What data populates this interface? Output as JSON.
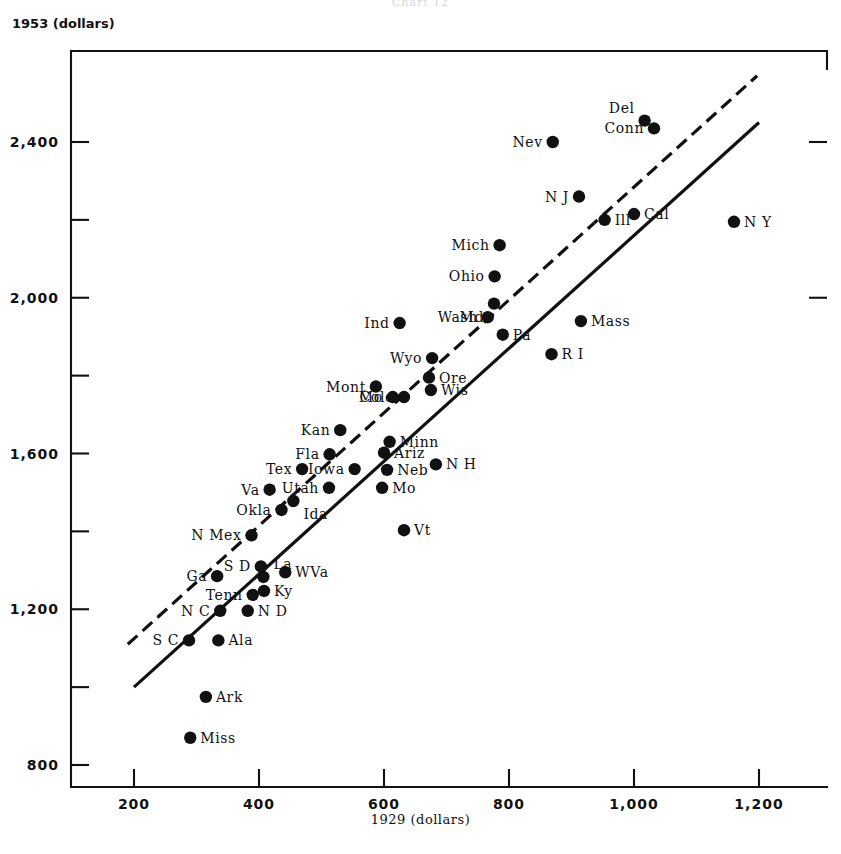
{
  "figure": {
    "cut_off_header": "Chart 12",
    "y_axis_caption": "1953 (dollars)",
    "x_axis_caption": "1929 (dollars)",
    "ink_color": "#111111",
    "background_color": "#ffffff"
  },
  "chart_data": {
    "type": "scatter",
    "title": "",
    "subtitle": "",
    "xlabel": "1929 (dollars)",
    "ylabel": "1953 (dollars)",
    "xlim": [
      130,
      1290
    ],
    "ylim": [
      760,
      2680
    ],
    "grid": false,
    "legend": "none",
    "x_ticks": [
      200,
      400,
      600,
      800,
      1000,
      1200
    ],
    "x_tick_labels": [
      "200",
      "400",
      "600",
      "800",
      "1,000",
      "1,200"
    ],
    "y_ticks": [
      800,
      1200,
      1600,
      2000,
      2400
    ],
    "y_tick_labels": [
      "800",
      "1,200",
      "1,600",
      "2,000",
      "2,400"
    ],
    "y_minor_ticks": [
      1000,
      1400,
      1800,
      2200
    ],
    "point_label": "State per-capita income",
    "points": [
      {
        "label": "Miss",
        "x": 290,
        "y": 870,
        "lx": -1,
        "ly": 0
      },
      {
        "label": "Ark",
        "x": 315,
        "y": 975,
        "lx": -1,
        "ly": 0
      },
      {
        "label": "S C",
        "x": 288,
        "y": 1120,
        "lx": 1,
        "ly": 0
      },
      {
        "label": "Ala",
        "x": 335,
        "y": 1120,
        "lx": -1,
        "ly": 0
      },
      {
        "label": "N C",
        "x": 338,
        "y": 1196,
        "lx": 1,
        "ly": 0
      },
      {
        "label": "N D",
        "x": 382,
        "y": 1196,
        "lx": -1,
        "ly": 0
      },
      {
        "label": "Tenn",
        "x": 390,
        "y": 1237,
        "lx": 1,
        "ly": 0
      },
      {
        "label": "Ky",
        "x": 408,
        "y": 1247,
        "lx": -1,
        "ly": 0
      },
      {
        "label": "Ga",
        "x": 333,
        "y": 1285,
        "lx": 1,
        "ly": 0
      },
      {
        "label": "La",
        "x": 407,
        "y": 1283,
        "lx": -1,
        "ly": -1
      },
      {
        "label": "WVa",
        "x": 442,
        "y": 1295,
        "lx": -1,
        "ly": 0
      },
      {
        "label": "S D",
        "x": 403,
        "y": 1310,
        "lx": 1,
        "ly": 0
      },
      {
        "label": "N Mex",
        "x": 388,
        "y": 1390,
        "lx": 1,
        "ly": 0
      },
      {
        "label": "Vt",
        "x": 632,
        "y": 1403,
        "lx": -1,
        "ly": 0
      },
      {
        "label": "Okla",
        "x": 436,
        "y": 1455,
        "lx": 1,
        "ly": 0
      },
      {
        "label": "Ida",
        "x": 455,
        "y": 1478,
        "lx": -1,
        "ly": 1
      },
      {
        "label": "Va",
        "x": 417,
        "y": 1507,
        "lx": 1,
        "ly": 0
      },
      {
        "label": "Utah",
        "x": 512,
        "y": 1512,
        "lx": 1,
        "ly": 0
      },
      {
        "label": "Mo",
        "x": 597,
        "y": 1512,
        "lx": -1,
        "ly": 0
      },
      {
        "label": "Tex",
        "x": 469,
        "y": 1560,
        "lx": 1,
        "ly": 0
      },
      {
        "label": "Iowa",
        "x": 553,
        "y": 1560,
        "lx": 1,
        "ly": 0
      },
      {
        "label": "Neb",
        "x": 605,
        "y": 1558,
        "lx": -1,
        "ly": 0
      },
      {
        "label": "N H",
        "x": 683,
        "y": 1572,
        "lx": -1,
        "ly": 0
      },
      {
        "label": "Fla",
        "x": 513,
        "y": 1598,
        "lx": 1,
        "ly": 0
      },
      {
        "label": "Ariz",
        "x": 600,
        "y": 1602,
        "lx": -1,
        "ly": 0
      },
      {
        "label": "Minn",
        "x": 609,
        "y": 1630,
        "lx": -1,
        "ly": 0
      },
      {
        "label": "Kan",
        "x": 530,
        "y": 1660,
        "lx": 1,
        "ly": 0
      },
      {
        "label": "Mo",
        "x": 614,
        "y": 1745,
        "lx": 1,
        "ly": 0
      },
      {
        "label": "Mont",
        "x": 587,
        "y": 1772,
        "lx": 1,
        "ly": 0
      },
      {
        "label": "Colo",
        "x": 632,
        "y": 1745,
        "lx": 1,
        "ly": 0
      },
      {
        "label": "Wis",
        "x": 675,
        "y": 1763,
        "lx": -1,
        "ly": 0
      },
      {
        "label": "Ore",
        "x": 672,
        "y": 1795,
        "lx": -1,
        "ly": 0
      },
      {
        "label": "Wyo",
        "x": 677,
        "y": 1845,
        "lx": 1,
        "ly": 0
      },
      {
        "label": "R I",
        "x": 868,
        "y": 1855,
        "lx": -1,
        "ly": 0
      },
      {
        "label": "Ind",
        "x": 625,
        "y": 1935,
        "lx": 1,
        "ly": 0
      },
      {
        "label": "Wash",
        "x": 766,
        "y": 1950,
        "lx": 1,
        "ly": 0
      },
      {
        "label": "Mass",
        "x": 915,
        "y": 1940,
        "lx": -1,
        "ly": 0
      },
      {
        "label": "Pa",
        "x": 790,
        "y": 1905,
        "lx": -1,
        "ly": 0
      },
      {
        "label": "Md",
        "x": 776,
        "y": 1985,
        "lx": 1,
        "ly": 1
      },
      {
        "label": "Ohio",
        "x": 777,
        "y": 2055,
        "lx": 1,
        "ly": 0
      },
      {
        "label": "Mich",
        "x": 785,
        "y": 2135,
        "lx": 1,
        "ly": 0
      },
      {
        "label": "Ill",
        "x": 953,
        "y": 2200,
        "lx": -1,
        "ly": 0
      },
      {
        "label": "Cal",
        "x": 1000,
        "y": 2215,
        "lx": -1,
        "ly": 0
      },
      {
        "label": "N Y",
        "x": 1160,
        "y": 2195,
        "lx": -1,
        "ly": 0
      },
      {
        "label": "N J",
        "x": 912,
        "y": 2260,
        "lx": 1,
        "ly": 0
      },
      {
        "label": "Nev",
        "x": 870,
        "y": 2400,
        "lx": 1,
        "ly": 0
      },
      {
        "label": "Del",
        "x": 1017,
        "y": 2455,
        "lx": 1,
        "ly": -1
      },
      {
        "label": "Conn",
        "x": 1032,
        "y": 2435,
        "lx": 1,
        "ly": 0
      }
    ],
    "fit_lines": [
      {
        "name": "solid-regression-line",
        "style": "solid",
        "x0": 200,
        "y0": 1000,
        "x1": 1200,
        "y1": 2450
      },
      {
        "name": "dashed-regression-line",
        "style": "dashed",
        "x0": 190,
        "y0": 1110,
        "x1": 1197,
        "y1": 2570
      }
    ]
  }
}
